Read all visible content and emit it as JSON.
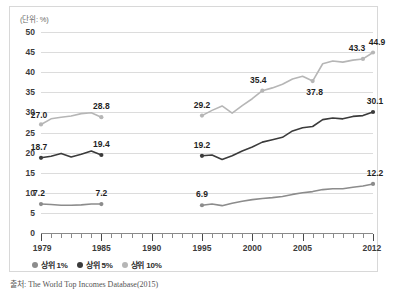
{
  "unit_label": "(단위: %)",
  "source_note": "출처: The World Top Incomes Database(2015)",
  "colors": {
    "top1": "#8c8c8c",
    "top5": "#3b3b3b",
    "top10": "#b6b6b6",
    "grid": "#dcdcdc",
    "axis": "#8a8a8a",
    "panel_border": "#d8d8d8",
    "text": "#1f1f1f"
  },
  "legend": {
    "items": [
      {
        "label": "상위 1%",
        "color": "#8c8c8c",
        "key": "top1"
      },
      {
        "label": "상위 5%",
        "color": "#3b3b3b",
        "key": "top5"
      },
      {
        "label": "상위 10%",
        "color": "#b6b6b6",
        "key": "top10"
      }
    ]
  },
  "chart_data": {
    "type": "line",
    "title": "",
    "subtitle": "",
    "xlabel": "",
    "ylabel": "",
    "unit": "%",
    "xlim": [
      1979,
      2012
    ],
    "ylim": [
      0,
      50
    ],
    "ytick_step": 5,
    "yticks": [
      0,
      5,
      10,
      15,
      20,
      25,
      30,
      35,
      40,
      45,
      50
    ],
    "xticks_major": [
      1979,
      1985,
      1990,
      1995,
      2000,
      2005,
      2012
    ],
    "xticks_minor_step": 1,
    "grid": "horizontal",
    "legend_position": "bottom-left",
    "data_gap": [
      1986,
      1994
    ],
    "series": [
      {
        "name": "상위 10%",
        "key": "top10",
        "color": "#b6b6b6",
        "x": [
          1979,
          1980,
          1981,
          1982,
          1983,
          1984,
          1985,
          1995,
          1996,
          1997,
          1998,
          1999,
          2000,
          2001,
          2002,
          2003,
          2004,
          2005,
          2006,
          2007,
          2008,
          2009,
          2010,
          2011,
          2012
        ],
        "values": [
          27.0,
          28.4,
          28.8,
          29.1,
          29.7,
          29.9,
          28.8,
          29.2,
          30.5,
          31.6,
          29.8,
          31.7,
          33.4,
          35.4,
          36.1,
          37.0,
          38.3,
          39.0,
          37.8,
          42.1,
          42.8,
          42.5,
          43.0,
          43.3,
          44.9
        ],
        "labeled_points": [
          {
            "x": 1979,
            "y": 27.0,
            "label": "27.0"
          },
          {
            "x": 1985,
            "y": 28.8,
            "label": "28.8"
          },
          {
            "x": 1995,
            "y": 29.2,
            "label": "29.2"
          },
          {
            "x": 2001,
            "y": 35.4,
            "label": "35.4"
          },
          {
            "x": 2006,
            "y": 37.8,
            "label": "37.8"
          },
          {
            "x": 2011,
            "y": 43.3,
            "label": "43.3"
          },
          {
            "x": 2012,
            "y": 44.9,
            "label": "44.9"
          }
        ]
      },
      {
        "name": "상위 5%",
        "key": "top5",
        "color": "#3b3b3b",
        "x": [
          1979,
          1980,
          1981,
          1982,
          1983,
          1984,
          1985,
          1995,
          1996,
          1997,
          1998,
          1999,
          2000,
          2001,
          2002,
          2003,
          2004,
          2005,
          2006,
          2007,
          2008,
          2009,
          2010,
          2011,
          2012
        ],
        "values": [
          18.7,
          19.1,
          19.8,
          18.9,
          19.6,
          20.4,
          19.4,
          19.2,
          19.4,
          18.3,
          19.2,
          20.4,
          21.4,
          22.6,
          23.2,
          23.8,
          25.4,
          26.2,
          26.5,
          28.2,
          28.6,
          28.4,
          29.0,
          29.2,
          30.1
        ],
        "labeled_points": [
          {
            "x": 1979,
            "y": 18.7,
            "label": "18.7"
          },
          {
            "x": 1985,
            "y": 19.4,
            "label": "19.4"
          },
          {
            "x": 1995,
            "y": 19.2,
            "label": "19.2"
          },
          {
            "x": 2012,
            "y": 30.1,
            "label": "30.1"
          }
        ]
      },
      {
        "name": "상위 1%",
        "key": "top1",
        "color": "#8c8c8c",
        "x": [
          1979,
          1980,
          1981,
          1982,
          1983,
          1984,
          1985,
          1995,
          1996,
          1997,
          1998,
          1999,
          2000,
          2001,
          2002,
          2003,
          2004,
          2005,
          2006,
          2007,
          2008,
          2009,
          2010,
          2011,
          2012
        ],
        "values": [
          7.2,
          7.1,
          6.9,
          6.9,
          7.0,
          7.2,
          7.2,
          6.9,
          7.2,
          6.8,
          7.4,
          7.9,
          8.3,
          8.6,
          8.8,
          9.1,
          9.6,
          10.0,
          10.3,
          10.8,
          11.0,
          11.0,
          11.4,
          11.7,
          12.2
        ],
        "labeled_points": [
          {
            "x": 1979,
            "y": 7.2,
            "label": "7.2"
          },
          {
            "x": 1985,
            "y": 7.2,
            "label": "7.2"
          },
          {
            "x": 1995,
            "y": 6.9,
            "label": "6.9"
          },
          {
            "x": 2012,
            "y": 12.2,
            "label": "12.2"
          }
        ]
      }
    ]
  }
}
